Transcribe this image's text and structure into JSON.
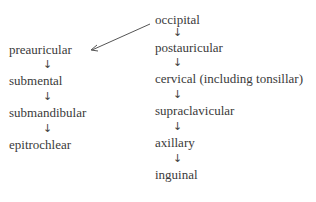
{
  "diagram": {
    "right_column": [
      "occipital",
      "postauricular",
      "cervical (including tonsillar)",
      "supraclavicular",
      "axillary",
      "inguinal"
    ],
    "left_column": [
      "preauricular",
      "submental",
      "submandibular",
      "epitrochlear"
    ],
    "arrow_glyph": "↓",
    "connector": {
      "from": "occipital",
      "to": "preauricular"
    }
  }
}
